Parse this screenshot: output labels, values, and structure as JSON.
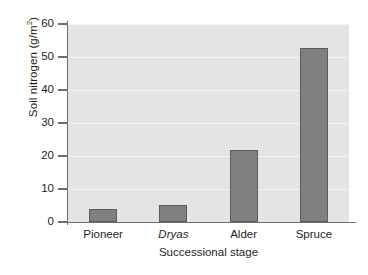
{
  "chart_data": {
    "type": "bar",
    "title": "",
    "categories": [
      "Pioneer",
      "Dryas",
      "Alder",
      "Spruce"
    ],
    "values": [
      3.8,
      5.2,
      21.8,
      52.8
    ],
    "xlabel": "Successional stage",
    "ylabel": "Soil nitrogen (g/m²)",
    "ylabel_main": "Soil nitrogen (g/m",
    "ylabel_sup": "2",
    "ylabel_tail": ")",
    "ylim": [
      0,
      62
    ],
    "yticks": [
      0,
      10,
      20,
      30,
      40,
      50,
      60
    ],
    "ytick_labels": [
      "0",
      "10",
      "20",
      "30",
      "40",
      "50",
      "60"
    ],
    "grid": true,
    "legend": null,
    "bar_color": "#808080",
    "bar_edge_color": "#5c5c5c",
    "plot_background": "#e4e4e2",
    "axis_color": "#6d6e70",
    "text_color": "#231f20",
    "italic_categories": [
      "Dryas"
    ]
  }
}
